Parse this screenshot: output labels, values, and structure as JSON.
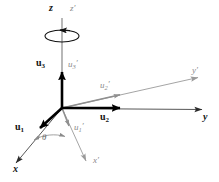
{
  "figure": {
    "type": "vector-diagram",
    "width": 219,
    "height": 182,
    "background_color": "#ffffff"
  },
  "colors": {
    "original_axis": "#2b2b2b",
    "basis_vector": "#000000",
    "rotated_axis": "#9a9a9a",
    "rotated_vector": "#8f8f8f",
    "label_dark": "#111111",
    "label_gray": "#8a8a8a"
  },
  "geometry": {
    "origin": {
      "x": 62,
      "y": 108
    }
  },
  "axes": [
    {
      "id": "z",
      "label": "z",
      "style": "original",
      "from": {
        "x": 62,
        "y": 108
      },
      "to": {
        "x": 62,
        "y": 12
      },
      "label_pos": {
        "x": 50,
        "y": 5
      }
    },
    {
      "id": "y",
      "label": "y",
      "style": "original",
      "from": {
        "x": 62,
        "y": 108
      },
      "to": {
        "x": 208,
        "y": 109
      },
      "label_pos": {
        "x": 204,
        "y": 112
      }
    },
    {
      "id": "x",
      "label": "x",
      "style": "original",
      "from": {
        "x": 62,
        "y": 108
      },
      "to": {
        "x": 12,
        "y": 168
      },
      "label_pos": {
        "x": 14,
        "y": 167
      }
    },
    {
      "id": "z-prime",
      "label": "z′",
      "style": "rotated",
      "from": {
        "x": 62,
        "y": 108
      },
      "to": {
        "x": 62,
        "y": 12
      },
      "label_pos": {
        "x": 70,
        "y": 4
      }
    },
    {
      "id": "y-prime",
      "label": "y′",
      "style": "rotated",
      "from": {
        "x": 62,
        "y": 108
      },
      "to": {
        "x": 203,
        "y": 76
      },
      "label_pos": {
        "x": 193,
        "y": 68
      }
    },
    {
      "id": "x-prime",
      "label": "x′",
      "style": "rotated",
      "from": {
        "x": 62,
        "y": 108
      },
      "to": {
        "x": 89,
        "y": 167
      },
      "label_pos": {
        "x": 94,
        "y": 160
      }
    }
  ],
  "vectors": [
    {
      "id": "u1",
      "label": "u",
      "subscript": "1",
      "prime": false,
      "style": "basis",
      "from": {
        "x": 62,
        "y": 108
      },
      "to": {
        "x": 35,
        "y": 133
      },
      "label_pos": {
        "x": 17,
        "y": 124
      }
    },
    {
      "id": "u2",
      "label": "u",
      "subscript": "2",
      "prime": false,
      "style": "basis",
      "from": {
        "x": 62,
        "y": 108
      },
      "to": {
        "x": 128,
        "y": 108
      },
      "label_pos": {
        "x": 104,
        "y": 113
      }
    },
    {
      "id": "u3",
      "label": "u",
      "subscript": "3",
      "prime": false,
      "style": "basis",
      "from": {
        "x": 62,
        "y": 108
      },
      "to": {
        "x": 62,
        "y": 64
      },
      "label_pos": {
        "x": 38,
        "y": 61
      }
    },
    {
      "id": "u1-prime",
      "label": "u",
      "subscript": "1",
      "prime": true,
      "style": "rotated-vector",
      "from": {
        "x": 62,
        "y": 108
      },
      "to": {
        "x": 70,
        "y": 132
      },
      "label_pos": {
        "x": 74,
        "y": 124
      }
    },
    {
      "id": "u2-prime",
      "label": "u",
      "subscript": "2",
      "prime": true,
      "style": "rotated-vector",
      "from": {
        "x": 62,
        "y": 108
      },
      "to": {
        "x": 126,
        "y": 93
      },
      "label_pos": {
        "x": 101,
        "y": 82
      }
    },
    {
      "id": "u3-prime",
      "label": "u",
      "subscript": "3",
      "prime": true,
      "style": "rotated-vector",
      "from": {
        "x": 62,
        "y": 108
      },
      "to": {
        "x": 62,
        "y": 64
      },
      "label_pos": {
        "x": 70,
        "y": 60
      }
    }
  ],
  "angle": {
    "id": "theta",
    "label": "θ",
    "label_pos": {
      "x": 42,
      "y": 138
    },
    "arc_from": {
      "x": 35,
      "y": 139
    },
    "arc_to": {
      "x": 66,
      "y": 137
    }
  },
  "rotation_indicator": {
    "id": "rotation-ellipse",
    "center": {
      "x": 62,
      "y": 36
    },
    "rx": 17,
    "ry": 6,
    "direction": "counterclockwise-about-z"
  }
}
